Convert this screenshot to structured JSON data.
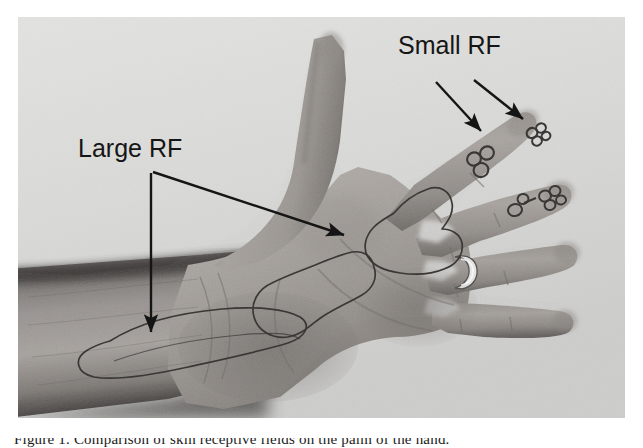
{
  "figure": {
    "kind": "photograph-with-annotations",
    "background_color": "#ffffff",
    "photo_background_color": "#d9d9d7",
    "ink_color": "#2a2a2a",
    "annotation_color": "#151515"
  },
  "labels": [
    {
      "id": "small-rf",
      "text": "Small RF",
      "x": 398,
      "y": 31,
      "font_size": 25
    },
    {
      "id": "large-rf",
      "text": "Large RF",
      "x": 78,
      "y": 134,
      "font_size": 25
    }
  ],
  "arrows": [
    {
      "id": "small-rf-arrow-left",
      "from_label": "Small RF",
      "points_to": "index-fingertip-small-receptive-field",
      "x1": 436,
      "y1": 82,
      "x2": 481,
      "y2": 131
    },
    {
      "id": "small-rf-arrow-right",
      "from_label": "Small RF",
      "points_to": "index-finger-distal-tip-receptive-field",
      "x1": 474,
      "y1": 80,
      "x2": 522,
      "y2": 120
    },
    {
      "id": "large-rf-arrow-vertical",
      "from_label": "Large RF",
      "points_to": "forearm-large-receptive-field",
      "x1": 151,
      "y1": 173,
      "x2": 151,
      "y2": 330
    },
    {
      "id": "large-rf-arrow-diagonal",
      "from_label": "Large RF",
      "points_to": "palm-large-receptive-field",
      "x1": 152,
      "y1": 172,
      "x2": 341,
      "y2": 234
    }
  ],
  "receptive_fields": {
    "large": [
      {
        "id": "palm-rf-proximal",
        "location": "mid palm, thenar side",
        "description": "irregular kidney-shaped ink outline"
      },
      {
        "id": "palm-rf-distal",
        "location": "mid palm toward finger bases",
        "description": "large irregular ink outline"
      },
      {
        "id": "forearm-rf",
        "location": "volar wrist and distal forearm",
        "description": "large elongated ink outline"
      }
    ],
    "small": [
      {
        "id": "index-finger-rf-middle",
        "location": "index finger middle phalanx",
        "description": "cluster of small ink circles"
      },
      {
        "id": "index-finger-rf-tip",
        "location": "index fingertip",
        "description": "cluster of small ink circles"
      },
      {
        "id": "middle-finger-rf",
        "location": "middle fingertip and distal phalanx",
        "description": "cluster of small ink circles"
      }
    ]
  },
  "photo_features": {
    "ring": {
      "location": "ring finger proximal phalanx",
      "description": "metal band ring"
    },
    "digits": [
      "thumb",
      "index",
      "middle",
      "ring",
      "little"
    ]
  },
  "caption": {
    "text": "Figure 1. Comparison of skin receptive fields on the palm of the hand.",
    "visible": "partially-cropped-bottom-edge"
  }
}
